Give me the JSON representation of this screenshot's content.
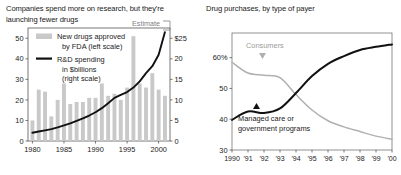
{
  "colors": {
    "bar": "#c9c9c9",
    "line_dark": "#111111",
    "line_grey": "#b0b0b0",
    "axis": "#555555",
    "text": "#1a1a1a",
    "estimate": "#808080",
    "background": "#ffffff"
  },
  "left_panel": {
    "title": "Companies spend more on research, but they're launching fewer drugs",
    "legend": {
      "bar_swatch_name": "bar-swatch",
      "bar_label_line1": "New drugs approved",
      "bar_label_line2": "by FDA (left scale)",
      "line_swatch_name": "line-swatch",
      "line_label_line1": "R&D spending",
      "line_label_line2": "in $billions",
      "line_label_line3": "(right scale)"
    },
    "estimate_annotation": "Estimate"
  },
  "right_panel": {
    "title": "Drug purchases, by type of payer",
    "annotations": {
      "consumers_label": "Consumers",
      "consumers_marker": "down-triangle-marker",
      "managed_label_line1": "Managed care or",
      "managed_label_line2": "government programs",
      "managed_marker": "up-triangle-marker"
    }
  },
  "chart_data": [
    {
      "id": "drugs-and-rd-chart",
      "type": "bar",
      "title": "Companies spend more on research, but they're launching fewer drugs",
      "xlabel": "",
      "ylabel": "",
      "grid": false,
      "legend_position": "top-left",
      "x": [
        1980,
        1981,
        1982,
        1983,
        1984,
        1985,
        1986,
        1987,
        1988,
        1989,
        1990,
        1991,
        1992,
        1993,
        1994,
        1995,
        1996,
        1997,
        1998,
        1999,
        2000,
        2001
      ],
      "xticks": [
        1980,
        1985,
        1990,
        1995,
        2000
      ],
      "xticklabels": [
        "1980",
        "1985",
        "1990",
        "1995",
        "2000"
      ],
      "xlim": [
        1979.3,
        2001.8
      ],
      "left_axis": {
        "name": "New drugs approved by FDA",
        "ylim": [
          0,
          55
        ],
        "yticks": [
          0,
          10,
          20,
          30,
          40,
          50
        ],
        "yticklabels": [
          "0",
          "10",
          "20",
          "30",
          "40",
          "50"
        ]
      },
      "right_axis": {
        "name": "R&D spending in $billions",
        "ylim": [
          0,
          27.5
        ],
        "yticks": [
          0,
          5,
          10,
          15,
          20,
          25
        ],
        "yticklabels": [
          "0",
          "5",
          "10",
          "15",
          "20",
          "$25"
        ]
      },
      "series": [
        {
          "name": "New drugs approved by FDA (left scale)",
          "type": "bar",
          "axis": "left",
          "color": "#c9c9c9",
          "values": [
            10,
            25,
            24,
            12,
            20,
            28,
            18,
            19,
            19,
            21,
            21,
            28,
            22,
            23,
            20,
            26,
            51,
            28,
            26,
            33,
            25,
            22
          ]
        },
        {
          "name": "R&D spending in $billions (right scale)",
          "type": "line",
          "axis": "right",
          "color": "#111111",
          "values": [
            2.0,
            2.3,
            2.6,
            2.9,
            3.3,
            3.8,
            4.3,
            4.9,
            5.5,
            6.2,
            7.0,
            8.0,
            9.2,
            10.5,
            11.2,
            11.9,
            13.0,
            14.5,
            16.5,
            18.2,
            21.0,
            26.5
          ]
        }
      ],
      "annotations": [
        {
          "text": "Estimate",
          "x": 2001,
          "note": "bracket over final estimated point"
        }
      ]
    },
    {
      "id": "drug-purchases-by-payer-chart",
      "type": "line",
      "title": "Drug purchases, by type of payer",
      "xlabel": "",
      "ylabel": "",
      "grid": false,
      "legend_position": "inline-annotations",
      "x": [
        1990,
        1991,
        1992,
        1993,
        1994,
        1995,
        1996,
        1997,
        1998,
        1999,
        2000
      ],
      "xticks": [
        1990,
        1991,
        1992,
        1993,
        1994,
        1995,
        1996,
        1997,
        1998,
        1999,
        2000
      ],
      "xticklabels": [
        "1990",
        "'91",
        "'92",
        "'93",
        "'94",
        "'95",
        "'96",
        "'97",
        "'98",
        "'99",
        "'00"
      ],
      "xlim": [
        1990,
        2000
      ],
      "ylim": [
        30,
        68
      ],
      "yticks": [
        30,
        40,
        50,
        60
      ],
      "yticklabels": [
        "30",
        "40",
        "50",
        "60%"
      ],
      "series": [
        {
          "name": "Consumers",
          "color": "#b0b0b0",
          "values": [
            58.5,
            55.0,
            54.3,
            53.5,
            48.0,
            43.0,
            39.5,
            37.5,
            36.0,
            34.5,
            33.5
          ]
        },
        {
          "name": "Managed care or government programs",
          "color": "#111111",
          "values": [
            39.8,
            42.5,
            42.0,
            43.5,
            48.5,
            54.0,
            58.0,
            60.5,
            62.5,
            63.5,
            64.3
          ]
        }
      ]
    }
  ]
}
